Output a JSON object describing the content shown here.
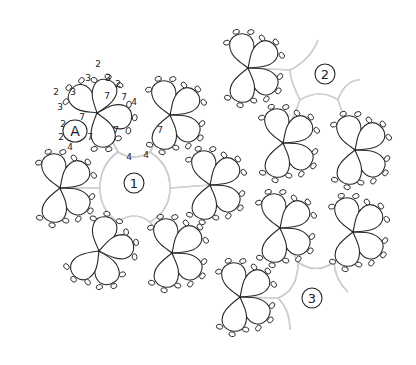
{
  "diagram": {
    "colors": {
      "rings": "#2a2a2a",
      "chains": "#b4b4b4",
      "background": "#ffffff"
    },
    "round_labels": [
      {
        "id": "1",
        "x": 134,
        "y": 183
      },
      {
        "id": "2",
        "x": 325,
        "y": 74
      },
      {
        "id": "3",
        "x": 312,
        "y": 298
      }
    ],
    "ring_label": {
      "text": "A",
      "x": 75,
      "y": 131
    },
    "stitch_counts": [
      {
        "text": "2",
        "x": 98,
        "y": 64
      },
      {
        "text": "3",
        "x": 88,
        "y": 78
      },
      {
        "text": "3",
        "x": 108,
        "y": 78
      },
      {
        "text": "2",
        "x": 118,
        "y": 84
      },
      {
        "text": "2",
        "x": 56,
        "y": 92
      },
      {
        "text": "3",
        "x": 73,
        "y": 92
      },
      {
        "text": "3",
        "x": 60,
        "y": 107
      },
      {
        "text": "7",
        "x": 107,
        "y": 96
      },
      {
        "text": "7",
        "x": 124,
        "y": 97
      },
      {
        "text": "4",
        "x": 134,
        "y": 102
      },
      {
        "text": "7",
        "x": 82,
        "y": 117
      },
      {
        "text": "2",
        "x": 63,
        "y": 124
      },
      {
        "text": "2",
        "x": 61,
        "y": 137
      },
      {
        "text": "7",
        "x": 90,
        "y": 137
      },
      {
        "text": "7",
        "x": 116,
        "y": 130
      },
      {
        "text": "7",
        "x": 160,
        "y": 130
      },
      {
        "text": "4",
        "x": 70,
        "y": 147
      },
      {
        "text": "4",
        "x": 129,
        "y": 157
      },
      {
        "text": "4",
        "x": 146,
        "y": 155
      }
    ],
    "flowers": [
      {
        "name": "flower-a",
        "cx": 97,
        "cy": 113,
        "rot": -30
      },
      {
        "name": "flower-b",
        "cx": 170,
        "cy": 115,
        "rot": 0
      },
      {
        "name": "flower-c",
        "cx": 60,
        "cy": 188,
        "rot": 0
      },
      {
        "name": "flower-d",
        "cx": 99,
        "cy": 251,
        "rot": 30
      },
      {
        "name": "flower-e",
        "cx": 172,
        "cy": 253,
        "rot": 0
      },
      {
        "name": "flower-f",
        "cx": 210,
        "cy": 185,
        "rot": 0
      },
      {
        "name": "flower-g",
        "cx": 248,
        "cy": 68,
        "rot": 0
      },
      {
        "name": "flower-h",
        "cx": 283,
        "cy": 143,
        "rot": 0
      },
      {
        "name": "flower-i",
        "cx": 355,
        "cy": 150,
        "rot": 0
      },
      {
        "name": "flower-j",
        "cx": 280,
        "cy": 228,
        "rot": 0
      },
      {
        "name": "flower-k",
        "cx": 353,
        "cy": 232,
        "rot": 0
      },
      {
        "name": "flower-l",
        "cx": 240,
        "cy": 297,
        "rot": 0
      }
    ],
    "chains": [
      "M97,113 L118,152",
      "M170,115 L150,152",
      "M60,188 L100,188",
      "M210,185 L170,188",
      "M99,251 L118,222",
      "M172,253 L150,222",
      "M118,152 Q134,162 150,152",
      "M150,152 Q170,165 170,188",
      "M170,188 Q170,210 150,222",
      "M150,222 Q134,210 118,222",
      "M118,222 Q100,210 100,188",
      "M100,188 Q100,165 118,152",
      "M248,68 L290,70",
      "M290,70 Q310,60 318,40",
      "M283,143 L300,100",
      "M355,150 L338,100",
      "M300,100 Q320,88 338,100",
      "M300,100 Q290,80 290,70",
      "M338,100 Q345,80 360,80",
      "M280,228 L298,262",
      "M353,232 L334,262",
      "M298,262 Q316,275 334,262",
      "M240,297 L278,298",
      "M278,298 Q298,290 298,262",
      "M278,298 Q290,310 290,330",
      "M334,262 Q335,280 348,292"
    ]
  }
}
